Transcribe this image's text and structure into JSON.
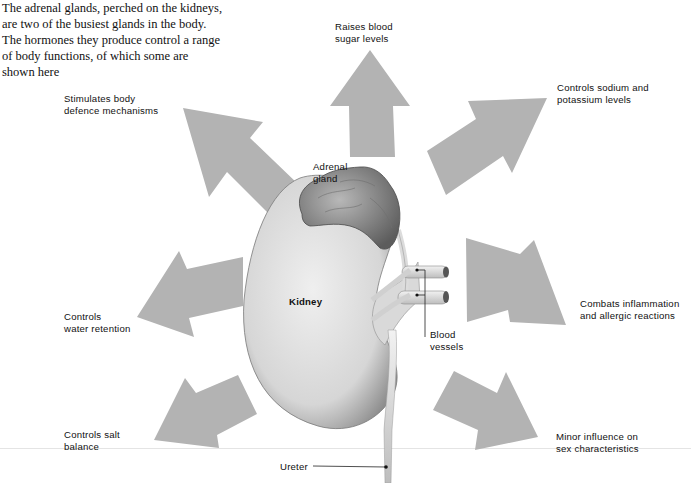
{
  "caption": {
    "lines": [
      "The adrenal glands, perched on the kidneys,",
      "are two of the busiest glands in the body.",
      "The hormones they produce control a range",
      "of body functions, of which some are",
      "shown here"
    ]
  },
  "anatomy_labels": {
    "adrenal_gland": [
      "Adrenal",
      "gland"
    ],
    "kidney": "Kidney",
    "blood_vessels": [
      "Blood",
      "vessels"
    ],
    "ureter": "Ureter"
  },
  "functions": [
    {
      "id": "sugar",
      "direction": "up",
      "lines": [
        "Raises blood",
        "sugar levels"
      ]
    },
    {
      "id": "sodium",
      "direction": "up-right",
      "lines": [
        "Controls sodium and",
        "potassium levels"
      ]
    },
    {
      "id": "inflammation",
      "direction": "right",
      "lines": [
        "Combats inflammation",
        "and allergic reactions"
      ]
    },
    {
      "id": "sex",
      "direction": "down-right",
      "lines": [
        "Minor influence on",
        "sex characteristics"
      ]
    },
    {
      "id": "salt",
      "direction": "down-left",
      "lines": [
        "Controls salt",
        "balance"
      ]
    },
    {
      "id": "water",
      "direction": "left",
      "lines": [
        "Controls",
        "water retention"
      ]
    },
    {
      "id": "defence",
      "direction": "up-left",
      "lines": [
        "Stimulates body",
        "defence mechanisms"
      ]
    }
  ],
  "colors": {
    "arrow": "#b3b3b3",
    "kidney_light": "#e6e6e6",
    "kidney_dark": "#8a8a8a",
    "text": "#111111"
  }
}
